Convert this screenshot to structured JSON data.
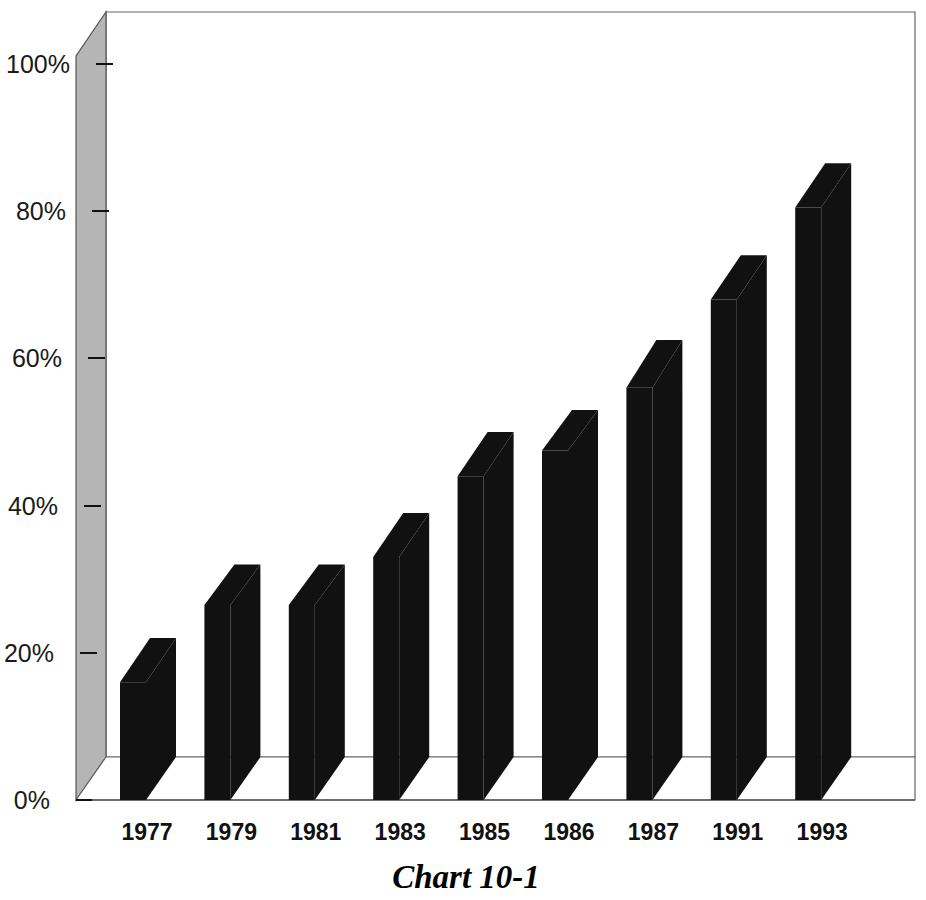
{
  "chart_data": {
    "type": "bar",
    "title": "Chart 10-1",
    "xlabel": "",
    "ylabel": "",
    "categories": [
      "1977",
      "1979",
      "1981",
      "1983",
      "1985",
      "1986",
      "1987",
      "1991",
      "1993"
    ],
    "values": [
      16,
      26.5,
      26.5,
      33,
      44,
      47.5,
      56,
      68,
      80.5
    ],
    "back_values": [
      22,
      32,
      32,
      39,
      50,
      53,
      62.5,
      74,
      86.5
    ],
    "ylim": [
      0,
      100
    ],
    "ytick_labels": [
      "0%",
      "20%",
      "40%",
      "60%",
      "80%",
      "100%"
    ],
    "ytick_values": [
      0,
      20,
      40,
      60,
      80,
      100
    ],
    "grid": false,
    "legend": null,
    "style": "3d-column",
    "bar_color": "#111111",
    "wall_color": "#b5b5b5",
    "floor_color": "#ffffff",
    "axis_line_color": "#555555"
  },
  "figure": {
    "background": "#ffffff"
  }
}
